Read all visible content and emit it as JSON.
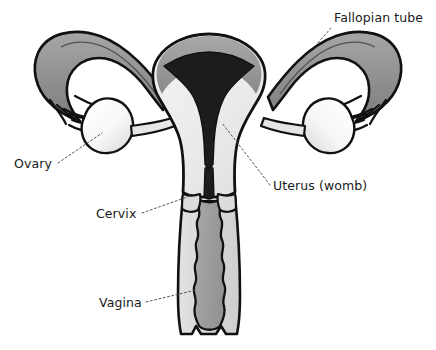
{
  "diagram": {
    "background_color": "#ffffff",
    "outline_color": "#111111",
    "labels": [
      {
        "id": "fallopian-tube",
        "text": "Fallopian tube",
        "text_x": 334,
        "text_y": 22,
        "anchor": "start",
        "leader": "M331,28 L317,44"
      },
      {
        "id": "ovary",
        "text": "Ovary",
        "text_x": 14,
        "text_y": 168,
        "anchor": "start",
        "leader": "M58,163 L102,133"
      },
      {
        "id": "uterus-womb",
        "text": "Uterus (womb)",
        "text_x": 273,
        "text_y": 190,
        "anchor": "start",
        "leader": "M270,185 L222,123"
      },
      {
        "id": "cervix",
        "text": "Cervix",
        "text_x": 96,
        "text_y": 218,
        "anchor": "start",
        "leader": "M142,213 L190,196"
      },
      {
        "id": "vagina",
        "text": "Vagina",
        "text_x": 99,
        "text_y": 307,
        "anchor": "start",
        "leader": "M146,302 L196,290"
      }
    ],
    "parts": [
      {
        "id": "fallopian-tube-left",
        "name": "Fallopian tube (left)",
        "fill": "#8f8f8f"
      },
      {
        "id": "fallopian-tube-right",
        "name": "Fallopian tube (right)",
        "fill": "#8f8f8f"
      },
      {
        "id": "ovary-left",
        "name": "Ovary (left)",
        "fill": "#f2f2f2"
      },
      {
        "id": "ovary-right",
        "name": "Ovary (right)",
        "fill": "#f2f2f2"
      },
      {
        "id": "uterus-body",
        "name": "Uterus (womb)",
        "fill": "#ececec"
      },
      {
        "id": "uterine-cavity",
        "name": "Endometrial cavity",
        "fill": "#1c1c1c"
      },
      {
        "id": "uterus-fundus-shade",
        "name": "Uterine fundus shading",
        "fill": "#9a9a9a"
      },
      {
        "id": "cervix-canal",
        "name": "Cervix",
        "fill": "#a3a3a3"
      },
      {
        "id": "vaginal-wall",
        "name": "Vaginal wall",
        "fill": "#d9d9d9"
      },
      {
        "id": "vaginal-canal",
        "name": "Vagina",
        "fill": "#a0a0a0"
      }
    ],
    "colors": {
      "outline": "#111111",
      "tube_fill": "#8f8f8f",
      "ovary_fill": "#f2f2f2",
      "uterus_fill": "#ececec",
      "cavity_fill": "#1c1c1c",
      "vaginal_wall_fill": "#d9d9d9",
      "vaginal_canal_fill": "#a0a0a0",
      "leader_line": "#555555",
      "text": "#1a1a1a"
    }
  }
}
